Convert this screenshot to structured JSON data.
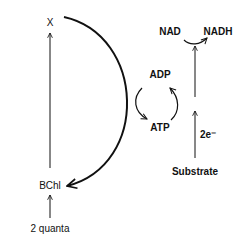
{
  "diagram": {
    "type": "bacterial photosynthesis electron flow scheme",
    "nodes": {
      "x": "X",
      "bchl": "BChl",
      "quanta": "2 quanta",
      "nad": "NAD",
      "nadh": "NADH",
      "adp": "ADP",
      "atp": "ATP",
      "electrons": "2e⁻",
      "substrate": "Substrate"
    },
    "edges": [
      {
        "from": "2 quanta",
        "to": "BChl"
      },
      {
        "from": "BChl",
        "to": "X"
      },
      {
        "from": "X",
        "to": "BChl",
        "style": "large arc (cyclic)"
      },
      {
        "from": "ADP",
        "to": "ATP",
        "style": "curved"
      },
      {
        "from": "ATP",
        "to": "ADP",
        "style": "curved"
      },
      {
        "from": "Substrate",
        "to": "NAD",
        "label": "2e⁻"
      },
      {
        "from": "NAD",
        "to": "NADH",
        "style": "curved"
      }
    ],
    "colors": {
      "stroke": "#111111",
      "background": "#ffffff"
    }
  }
}
